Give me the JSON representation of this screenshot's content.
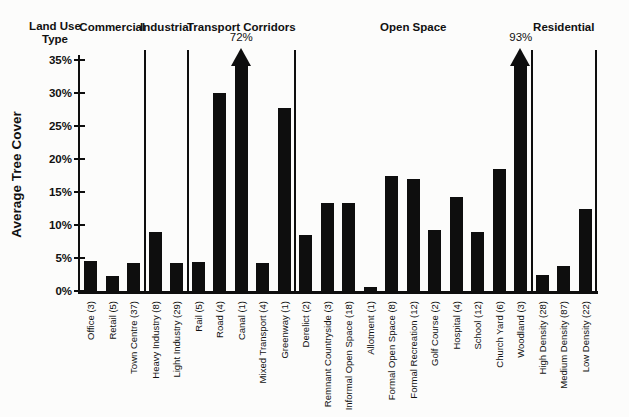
{
  "figure": {
    "background": "#fcfcfb",
    "ink_color": "#0e0e0e"
  },
  "chart_data": {
    "type": "bar",
    "corner_label": "Land Use Type",
    "ylabel": "Average Tree Cover",
    "xlabel": "",
    "ylim": [
      0,
      35
    ],
    "ytick_step": 5,
    "ytick_labels": [
      "0%",
      "5%",
      "10%",
      "15%",
      "20%",
      "25%",
      "30%",
      "35%"
    ],
    "bar_color": "#0e0e0e",
    "legend": "none",
    "grid": "off",
    "groups": [
      {
        "label": "Commercial",
        "bars": [
          {
            "category": "Office (3)",
            "value": 4.5
          },
          {
            "category": "Retail (5)",
            "value": 2.3
          },
          {
            "category": "Town Centre (37)",
            "value": 4.2
          }
        ]
      },
      {
        "label": "Industrial",
        "bars": [
          {
            "category": "Heavy Industry (8)",
            "value": 8.9
          },
          {
            "category": "Light Industry (29)",
            "value": 4.2
          }
        ]
      },
      {
        "label": "Transport Corridors",
        "bars": [
          {
            "category": "Rail (5)",
            "value": 4.4
          },
          {
            "category": "Road (4)",
            "value": 30.0
          },
          {
            "category": "Canal (1)",
            "value": 72.0,
            "clipped": true,
            "annotation": "72%"
          },
          {
            "category": "Mixed Transport (4)",
            "value": 4.3
          },
          {
            "category": "Greenway (1)",
            "value": 27.8
          }
        ]
      },
      {
        "label": "Open Space",
        "bars": [
          {
            "category": "Derelict (2)",
            "value": 8.5
          },
          {
            "category": "Remnant Countryside (3)",
            "value": 13.4
          },
          {
            "category": "Informal Open Space (18)",
            "value": 13.4
          },
          {
            "category": "Allotment (1)",
            "value": 0.6
          },
          {
            "category": "Formal Open Space (8)",
            "value": 17.4
          },
          {
            "category": "Formal Recreation (12)",
            "value": 17.0
          },
          {
            "category": "Golf Course (2)",
            "value": 9.2
          },
          {
            "category": "Hospital (4)",
            "value": 14.2
          },
          {
            "category": "School (12)",
            "value": 9.0
          },
          {
            "category": "Church Yard (6)",
            "value": 18.5
          },
          {
            "category": "Woodland (3)",
            "value": 93.0,
            "clipped": true,
            "annotation": "93%"
          }
        ]
      },
      {
        "label": "Residential",
        "bars": [
          {
            "category": "High Density (28)",
            "value": 2.4
          },
          {
            "category": "Medium Density (87)",
            "value": 3.8
          },
          {
            "category": "Low Density (22)",
            "value": 12.5
          }
        ]
      }
    ]
  }
}
